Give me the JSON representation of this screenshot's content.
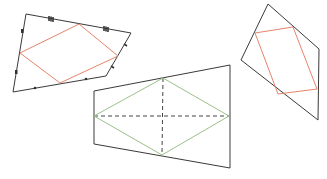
{
  "figure": {
    "colors": {
      "outline": "#3a3a3a",
      "orange_inner": "#e8836a",
      "green_inner": "#9cc08a",
      "diagonals": "#444444"
    },
    "shapes": [
      {
        "id": "left-quadrilateral",
        "inner_color": "orange",
        "equal_segment_marks": [
          "triple-tick",
          "triple-tick",
          "single-tick",
          "single-tick",
          "single-dot",
          "single-dot",
          "double-dot",
          "double-dot"
        ]
      },
      {
        "id": "center-quadrilateral",
        "inner_color": "green",
        "dashed_diagonals": true
      },
      {
        "id": "right-quadrilateral",
        "inner_color": "orange"
      }
    ]
  }
}
